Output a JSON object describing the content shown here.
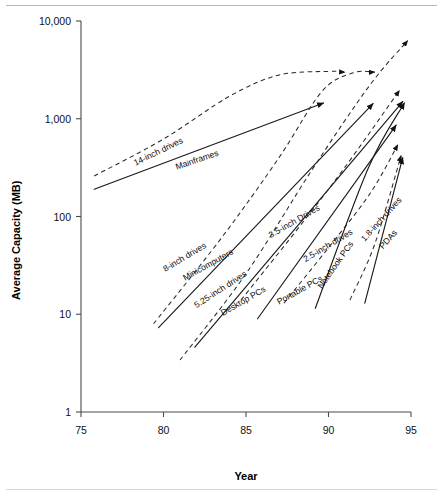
{
  "figure": {
    "y_axis_title": "Average Capacity (MB)",
    "x_axis_title": "Year"
  },
  "chart_data": {
    "type": "line",
    "title": "",
    "subtitle": "",
    "xlabel": "Year",
    "ylabel": "Average Capacity (MB)",
    "xlim": [
      75,
      95
    ],
    "ylim": [
      1,
      10000
    ],
    "yscale": "log",
    "xticks": [
      75,
      80,
      85,
      90,
      95
    ],
    "xticklabels": [
      "75",
      "80",
      "85",
      "90",
      "95"
    ],
    "yticks": [
      1,
      10,
      100,
      1000,
      10000
    ],
    "yticklabels": [
      "1",
      "10",
      "100",
      "1,000",
      "10,000"
    ],
    "grid": false,
    "legend": "inline-annotations",
    "arrowheads": true,
    "series": [
      {
        "name": "14-inch drives",
        "style": "dashed",
        "label": "14-inch drives",
        "label_x": 78.3,
        "label_y": 330,
        "label_rotation": -26,
        "points": [
          {
            "x": 75.8,
            "y": 260
          },
          {
            "x": 80.0,
            "y": 620
          },
          {
            "x": 84.0,
            "y": 1700
          },
          {
            "x": 87.0,
            "y": 2800
          },
          {
            "x": 90.0,
            "y": 3050
          },
          {
            "x": 91.0,
            "y": 3000
          }
        ]
      },
      {
        "name": "Mainframes",
        "style": "solid",
        "label": "Mainframes",
        "label_x": 80.8,
        "label_y": 300,
        "label_rotation": -19,
        "points": [
          {
            "x": 75.8,
            "y": 190
          },
          {
            "x": 89.7,
            "y": 1450
          }
        ]
      },
      {
        "name": "8-inch drives",
        "style": "dashed",
        "label": "8-inch drives",
        "label_x": 80.1,
        "label_y": 27,
        "label_rotation": -31,
        "points": [
          {
            "x": 79.4,
            "y": 8.0
          },
          {
            "x": 83.5,
            "y": 60
          },
          {
            "x": 87.0,
            "y": 400
          },
          {
            "x": 89.6,
            "y": 1900
          },
          {
            "x": 91.5,
            "y": 2950
          },
          {
            "x": 92.8,
            "y": 3000
          }
        ]
      },
      {
        "name": "Minicomputers",
        "style": "solid",
        "label": "Minicomputers",
        "label_x": 81.3,
        "label_y": 22,
        "label_rotation": -29,
        "points": [
          {
            "x": 79.7,
            "y": 7.3
          },
          {
            "x": 92.7,
            "y": 1430
          }
        ]
      },
      {
        "name": "5.25-inch drives",
        "style": "dashed",
        "label": "5.25-inch drives",
        "label_x": 82.0,
        "label_y": 11.5,
        "label_rotation": -33,
        "points": [
          {
            "x": 81.0,
            "y": 3.4
          },
          {
            "x": 85.0,
            "y": 26
          },
          {
            "x": 89.0,
            "y": 300
          },
          {
            "x": 92.5,
            "y": 2200
          },
          {
            "x": 94.8,
            "y": 6300
          }
        ]
      },
      {
        "name": "Desktop PCs",
        "style": "solid",
        "label": "Desktop PCs",
        "label_x": 83.6,
        "label_y": 9.6,
        "label_rotation": -30,
        "points": [
          {
            "x": 81.9,
            "y": 4.6
          },
          {
            "x": 94.5,
            "y": 1500
          }
        ]
      },
      {
        "name": "3.5-inch Drives",
        "style": "dashed",
        "label": "3.5-inch Drives",
        "label_x": 86.5,
        "label_y": 60,
        "label_rotation": -30,
        "points": [
          {
            "x": 84.7,
            "y": 14
          },
          {
            "x": 88.0,
            "y": 70
          },
          {
            "x": 91.0,
            "y": 320
          },
          {
            "x": 94.3,
            "y": 1950
          }
        ]
      },
      {
        "name": "Portable PCs",
        "style": "solid",
        "label": "Portable PCs",
        "label_x": 87.0,
        "label_y": 12.5,
        "label_rotation": -29,
        "points": [
          {
            "x": 85.7,
            "y": 9.0
          },
          {
            "x": 94.1,
            "y": 860
          }
        ]
      },
      {
        "name": "2.5-inch drives",
        "style": "dashed",
        "label": "2.5-inch drives",
        "label_x": 88.6,
        "label_y": 34,
        "label_rotation": -31,
        "points": [
          {
            "x": 87.3,
            "y": 13
          },
          {
            "x": 90.0,
            "y": 48
          },
          {
            "x": 92.5,
            "y": 170
          },
          {
            "x": 94.2,
            "y": 540
          }
        ]
      },
      {
        "name": "Notebook PCs",
        "style": "solid",
        "label": "Notebook PCs",
        "label_x": 89.6,
        "label_y": 18,
        "label_rotation": -55,
        "points": [
          {
            "x": 89.2,
            "y": 11.5
          },
          {
            "x": 92.4,
            "y": 310
          },
          {
            "x": 94.6,
            "y": 1450
          }
        ]
      },
      {
        "name": "1.8-inch drives",
        "style": "dashed",
        "label": "1.8-inch drives",
        "label_x": 92.2,
        "label_y": 55,
        "label_rotation": -48,
        "points": [
          {
            "x": 91.3,
            "y": 14
          },
          {
            "x": 92.8,
            "y": 52
          },
          {
            "x": 94.4,
            "y": 420
          }
        ]
      },
      {
        "name": "PDAs",
        "style": "solid",
        "label": "PDAs",
        "label_x": 93.3,
        "label_y": 46,
        "label_rotation": -48,
        "points": [
          {
            "x": 92.2,
            "y": 13
          },
          {
            "x": 94.5,
            "y": 400
          }
        ]
      }
    ]
  }
}
